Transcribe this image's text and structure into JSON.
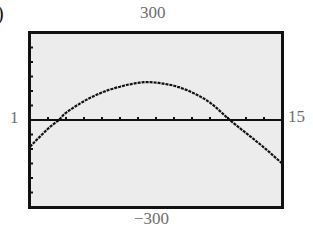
{
  "figure": {
    "corner_label": ")",
    "window": {
      "xmin_label": "1",
      "xmax_label": "15",
      "ymin_label": "−300",
      "ymax_label": "300"
    },
    "colors": {
      "screen_bg": "#eeeeee",
      "ink": "#111111",
      "label": "#6e6e6e"
    }
  },
  "chart_data": {
    "type": "line",
    "title": "",
    "xlabel": "",
    "ylabel": "",
    "xlim": [
      1,
      15
    ],
    "ylim": [
      -300,
      300
    ],
    "x_tick_step": 1,
    "y_tick_step": 50,
    "grid": false,
    "axes": "x-axis drawn at y=0 with tick marks",
    "tick_labels": {
      "left": "1",
      "right": "15",
      "top": "300",
      "bottom": "−300"
    },
    "series": [
      {
        "name": "y",
        "x": [
          1,
          2,
          2.6,
          3,
          4,
          5,
          6,
          7,
          7.8,
          9,
          10,
          11,
          12.1,
          13,
          14,
          15
        ],
        "values": [
          -92,
          -30,
          0,
          25,
          65,
          95,
          115,
          128,
          130,
          118,
          95,
          60,
          0,
          -45,
          -95,
          -150
        ]
      }
    ]
  }
}
